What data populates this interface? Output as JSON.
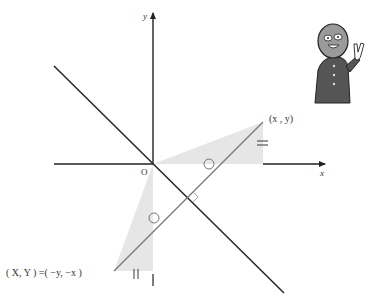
{
  "diagram": {
    "colors": {
      "axis": "#222222",
      "mirror_line": "#2a2a2a",
      "segment": "#777777",
      "shade": "#e6e6e6",
      "mark": "#777777",
      "text": "#333333"
    },
    "axes": {
      "x_label": "x",
      "y_label": "y",
      "origin_label": "O"
    },
    "points": {
      "P": {
        "label": "(x , y)"
      },
      "Q": {
        "label": "( X, Y ) =( −y, −x )"
      }
    },
    "marks": {
      "equal_double": "=",
      "equal_double_vertical": "||",
      "single_tick": "|",
      "angle_circle": "○",
      "right_angle": "⌐"
    },
    "character": {
      "description": "masked character giving a peace sign",
      "icon": "mascot-peace-sign"
    }
  }
}
